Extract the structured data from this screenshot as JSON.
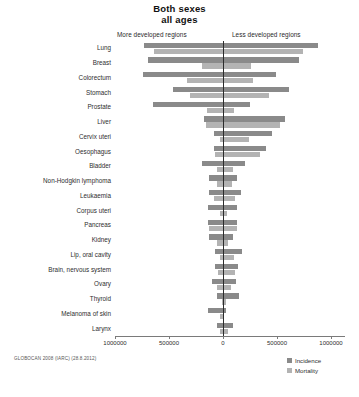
{
  "title": {
    "line1": "Both sexes",
    "line2": "all ages"
  },
  "regions": {
    "left_label": "More developed regions",
    "right_label": "Less developed regions"
  },
  "legend": {
    "position": "bottom-right",
    "items": [
      {
        "label": "Incidence",
        "color": "#8a8a8a"
      },
      {
        "label": "Mortality",
        "color": "#b3b3b3"
      }
    ]
  },
  "source_note": "GLOBOCAN 2008 (IARC) (28.8.2012)",
  "axis": {
    "tick_labels": [
      "1000000",
      "500000",
      "0",
      "500000",
      "1000000"
    ],
    "tick_values": [
      -1000000,
      -500000,
      0,
      500000,
      1000000
    ],
    "min": -1100000,
    "max": 1100000,
    "grid": false
  },
  "chart_data": {
    "type": "bar",
    "orientation": "horizontal-diverging",
    "title": "Both sexes all ages",
    "subtitle": "GLOBOCAN 2008 (IARC) (28.8.2012)",
    "xlabel": "",
    "ylabel": "",
    "xlim": [
      -1100000,
      1100000
    ],
    "grid": false,
    "legend_position": "bottom-right",
    "left_group": "More developed regions",
    "right_group": "Less developed regions",
    "categories": [
      "Lung",
      "Breast",
      "Colorectum",
      "Stomach",
      "Prostate",
      "Liver",
      "Cervix uteri",
      "Oesophagus",
      "Bladder",
      "Non-Hodgkin lymphoma",
      "Leukaemia",
      "Corpus uteri",
      "Pancreas",
      "Kidney",
      "Lip, oral cavity",
      "Brain, nervous system",
      "Ovary",
      "Thyroid",
      "Melanoma of skin",
      "Larynx"
    ],
    "series": [
      {
        "name": "Incidence",
        "color": "#8a8a8a",
        "more_developed": [
          730000,
          690000,
          740000,
          460000,
          650000,
          180000,
          80000,
          80000,
          190000,
          130000,
          130000,
          140000,
          140000,
          130000,
          70000,
          70000,
          100000,
          60000,
          140000,
          60000
        ],
        "less_developed": [
          880000,
          700000,
          490000,
          610000,
          250000,
          570000,
          450000,
          400000,
          200000,
          130000,
          170000,
          130000,
          130000,
          90000,
          180000,
          140000,
          120000,
          150000,
          30000,
          90000
        ]
      },
      {
        "name": "Mortality",
        "color": "#b3b3b3",
        "more_developed": [
          640000,
          190000,
          330000,
          310000,
          150000,
          160000,
          30000,
          70000,
          60000,
          60000,
          80000,
          30000,
          130000,
          60000,
          30000,
          50000,
          60000,
          10000,
          30000,
          30000
        ],
        "less_developed": [
          740000,
          260000,
          280000,
          430000,
          100000,
          530000,
          240000,
          340000,
          90000,
          80000,
          110000,
          40000,
          130000,
          50000,
          100000,
          110000,
          70000,
          30000,
          10000,
          50000
        ]
      }
    ]
  }
}
